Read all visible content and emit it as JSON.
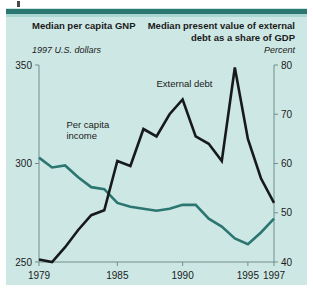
{
  "figure": {
    "background_color": "#cde8e4",
    "accent_color": "#2c7672",
    "debt_line_color": "#17191b",
    "income_line_color": "#2c7672"
  },
  "headings": {
    "left_title": "Median per capita GNP",
    "left_subtitle": "1997 U.S. dollars",
    "right_title": "Median present value of external debt as a share of GDP",
    "right_subtitle": "Percent"
  },
  "chart_data": {
    "type": "line",
    "title": "",
    "xlabel": "",
    "ylabel": "1997 U.S. dollars",
    "y2label": "Percent",
    "grid": false,
    "legend": "inline-annotations",
    "xlim": [
      1979,
      1997
    ],
    "xticks": [
      1979,
      1985,
      1990,
      1995,
      1997
    ],
    "xtick_labels": [
      "1979",
      "1985",
      "1990",
      "1995",
      "1997"
    ],
    "ylim": [
      250,
      350
    ],
    "yticks": [
      250,
      300,
      350
    ],
    "ytick_labels": [
      "250",
      "300",
      "350"
    ],
    "y2lim": [
      40,
      80
    ],
    "y2ticks": [
      40,
      50,
      60,
      70,
      80
    ],
    "y2tick_labels": [
      "40",
      "50",
      "60",
      "70",
      "80"
    ],
    "x": [
      1979,
      1980,
      1981,
      1982,
      1983,
      1984,
      1985,
      1986,
      1987,
      1988,
      1989,
      1990,
      1991,
      1992,
      1993,
      1994,
      1995,
      1996,
      1997
    ],
    "series": [
      {
        "name": "Per capita income",
        "axis": "left",
        "units": "1997 U.S. dollars",
        "color": "#2c7672",
        "label_text": "Per capita\nincome",
        "values": [
          303,
          298,
          299,
          293,
          288,
          287,
          280,
          278,
          277,
          276,
          277,
          279,
          279,
          272,
          268,
          262,
          259,
          265,
          272
        ]
      },
      {
        "name": "External debt",
        "axis": "right",
        "units": "Percent",
        "color": "#17191b",
        "label_text": "External debt",
        "values": [
          40.5,
          40.0,
          43.0,
          46.5,
          49.5,
          50.5,
          60.5,
          59.5,
          67.0,
          65.5,
          70.0,
          73.0,
          65.5,
          64.0,
          60.5,
          79.5,
          65.0,
          57.0,
          52.0
        ]
      }
    ],
    "annotations": [
      {
        "text": "Per capita income",
        "x": 1981.1,
        "y_axis": "left",
        "y": 318
      },
      {
        "text": "External debt",
        "x": 1988.0,
        "y_axis": "right",
        "y": 75.5
      }
    ]
  }
}
